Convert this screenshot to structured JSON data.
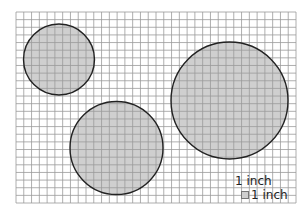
{
  "grid": {
    "x": 16,
    "y": 12,
    "width": 280,
    "height": 191,
    "columns": 36,
    "rows": 25,
    "line_color": "#9a9a9a",
    "background": "#ffffff"
  },
  "circles": [
    {
      "id": "small",
      "cx": 59,
      "cy": 59.5,
      "r": 35.5
    },
    {
      "id": "medium",
      "cx": 116.5,
      "cy": 148,
      "r": 46.5
    },
    {
      "id": "large",
      "cx": 229.5,
      "cy": 100.5,
      "r": 58.5
    }
  ],
  "circle_style": {
    "fill": "#cfcfcf",
    "fill_opacity": 0.85,
    "stroke": "#222222",
    "stroke_width": 1.4
  },
  "legend": {
    "top_label": "1 inch",
    "side_label": "1 inch"
  }
}
